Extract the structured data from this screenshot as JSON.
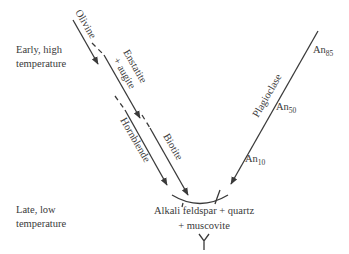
{
  "labels": {
    "early": [
      "Early, high",
      "temperature"
    ],
    "late": [
      "Late, low",
      "temperature"
    ],
    "olivine": "Olivine",
    "enstatite": "Enstatite",
    "augite": "+ augite",
    "hornblende": "Hornblende",
    "biotite": "Biotite",
    "plagioclase": "Plagioclase",
    "an85": {
      "base": "An",
      "sub": "85"
    },
    "an50": {
      "base": "An",
      "sub": "50"
    },
    "an10": {
      "base": "An",
      "sub": "10"
    },
    "final": [
      "Alkali feldspar + quartz",
      "+ muscovite"
    ]
  },
  "colors": {
    "ink": "#3a3a3a",
    "background": "#ffffff"
  }
}
